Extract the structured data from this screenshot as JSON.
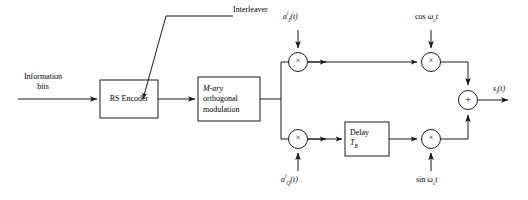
{
  "diagram": {
    "stroke_color": "#1a1a1a",
    "background_color": "#ffffff",
    "input": {
      "label_line1": "Information",
      "label_line2": "bits"
    },
    "annotations": {
      "interleaver": "Interleaver"
    },
    "blocks": [
      {
        "id": "rs-encoder",
        "label": "RS Encoder"
      },
      {
        "id": "mary-modulation",
        "label_line1": "M-ary",
        "label_line2": "orthogonal",
        "label_line3": "modulation"
      },
      {
        "id": "delay",
        "label_line1": "Delay",
        "label_line2": "T",
        "label_line2_sub": "B"
      }
    ],
    "operators": {
      "multiply_glyph": "×",
      "sum_glyph": "+"
    },
    "signals": {
      "spreading_i": {
        "base": "a",
        "sub": "I",
        "sup": "i",
        "arg": "(t)"
      },
      "spreading_q": {
        "base": "a",
        "sub": "Q",
        "sup": "i",
        "arg": "(t)"
      },
      "carrier_cos": {
        "fn": "cos ",
        "omega": "ω",
        "sub": "c",
        "var": "t"
      },
      "carrier_sin": {
        "fn": "sin ",
        "omega": "ω",
        "sub": "c",
        "var": "t"
      },
      "output": {
        "base": "s",
        "sub": "i",
        "arg": "(t)"
      }
    }
  }
}
